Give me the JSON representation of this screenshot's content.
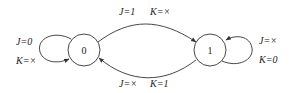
{
  "diagram": {
    "type": "state-diagram",
    "states": [
      {
        "id": "s0",
        "label": "0"
      },
      {
        "id": "s1",
        "label": "1"
      }
    ],
    "transitions": [
      {
        "from": "0",
        "to": "1",
        "j_label": "J=1",
        "k_label": "K=×"
      },
      {
        "from": "1",
        "to": "0",
        "j_label": "J=×",
        "k_label": "K=1"
      },
      {
        "from": "0",
        "to": "0",
        "j_label": "J=0",
        "k_label": "K=×"
      },
      {
        "from": "1",
        "to": "1",
        "j_label": "J=×",
        "k_label": "K=0"
      }
    ],
    "colors": {
      "stroke": "#333333",
      "text": "#222222",
      "background": "#ffffff"
    }
  }
}
